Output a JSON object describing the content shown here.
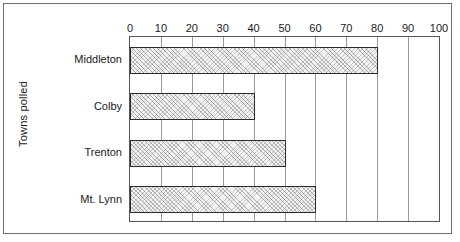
{
  "chart_data": {
    "type": "bar",
    "orientation": "horizontal",
    "title": "",
    "xlabel": "",
    "ylabel": "Towns polled",
    "categories": [
      "Middleton",
      "Colby",
      "Trenton",
      "Mt. Lynn"
    ],
    "values": [
      80,
      40,
      50,
      60
    ],
    "xlim": [
      0,
      100
    ],
    "xticks": [
      0,
      10,
      20,
      30,
      40,
      50,
      60,
      70,
      80,
      90,
      100
    ],
    "xtick_labels": [
      "0",
      "10",
      "20",
      "30",
      "40",
      "50",
      "60",
      "70",
      "80",
      "90",
      "100"
    ],
    "grid": true,
    "grid_axis": "x",
    "legend": null,
    "series": [
      {
        "name": "Towns polled",
        "values": [
          80,
          40,
          50,
          60
        ]
      }
    ],
    "colors": {
      "bar_fill": "#f2f2f2",
      "bar_hatch": "#6e6e6e",
      "bar_border": "#2b2b2b",
      "gridline": "#9a9a9a",
      "axis_border": "#555555",
      "frame_border": "#6f6f6f",
      "text": "#1a1a1a",
      "background": "#ffffff"
    }
  }
}
